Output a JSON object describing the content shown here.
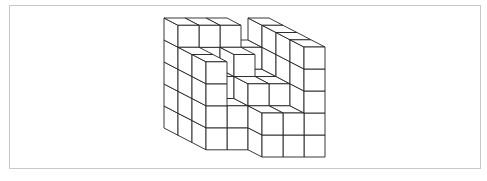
{
  "figure": {
    "frame_color": "#c8c8c8",
    "line_color": "#222222",
    "face_color": "#ffffff",
    "origin": [
      164,
      128
    ],
    "unit_x": [
      21,
      0
    ],
    "unit_y": [
      0,
      -22
    ],
    "unit_z": [
      14,
      7.25
    ],
    "heightmap_rows_back_to_front": [
      [
        5,
        5,
        5,
        4,
        5
      ],
      [
        4,
        3,
        4,
        3,
        5
      ],
      [
        4,
        2,
        3,
        3,
        5
      ],
      [
        2,
        2,
        2,
        2,
        5
      ]
    ],
    "front_cut": [
      [
        0,
        0,
        0,
        0,
        0
      ],
      [
        0,
        0,
        0,
        0,
        0
      ],
      [
        0,
        0,
        0,
        0,
        0
      ],
      [
        1,
        1,
        0,
        0,
        0
      ]
    ]
  }
}
